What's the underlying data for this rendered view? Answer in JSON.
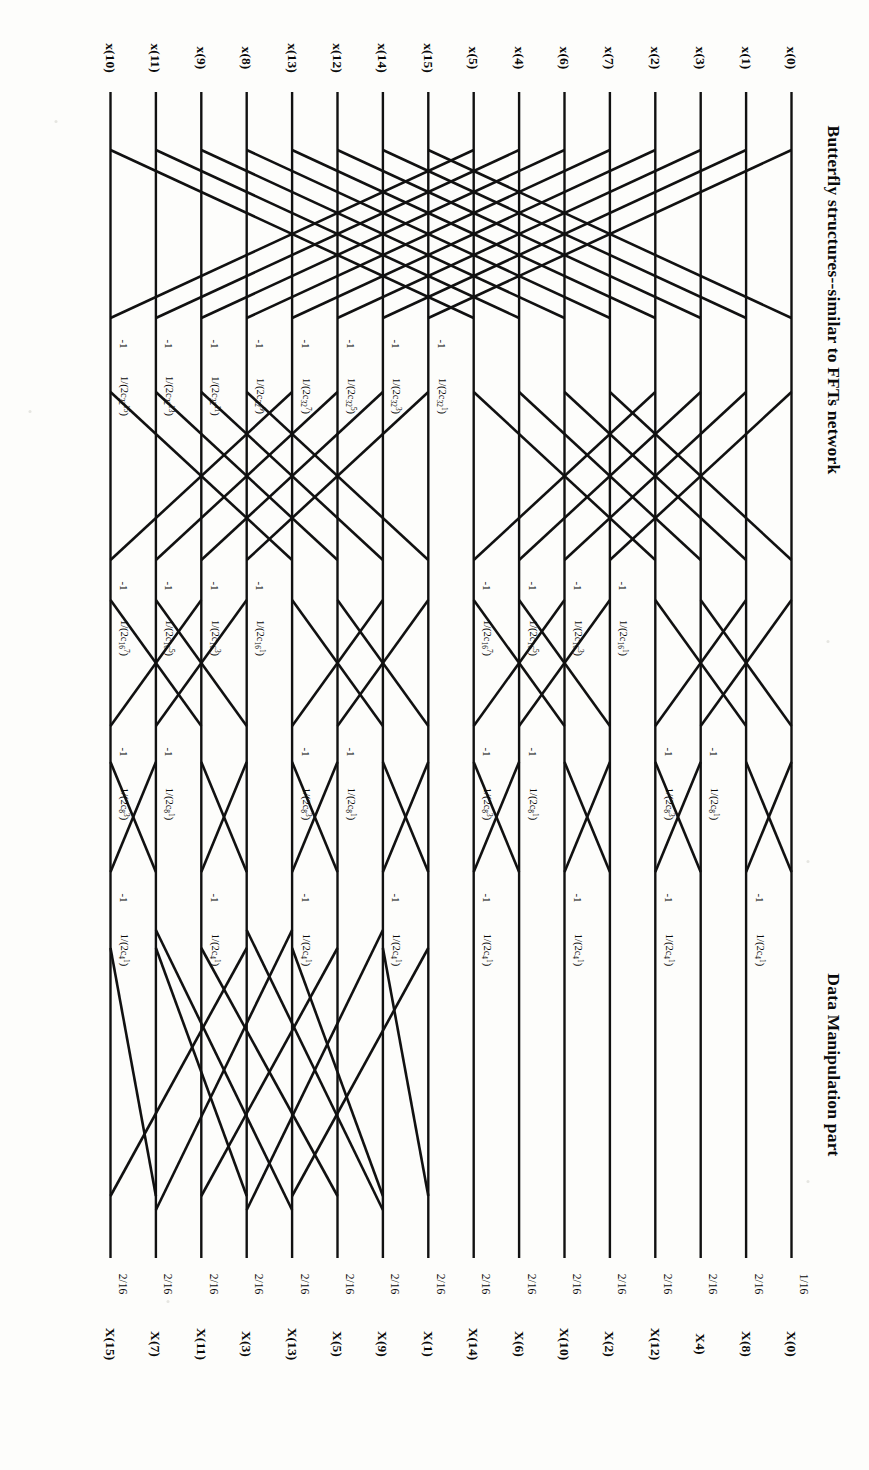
{
  "figure": {
    "title_left": "Butterfly structures--similar to FFTs network",
    "title_right": "Data Manipulation part",
    "type": "signal-flow-graph",
    "n_points": 16,
    "stages": 4,
    "line_color": "#111111",
    "background": "#fdfdfb"
  },
  "inputs": [
    "x(0)",
    "x(1)",
    "x(3)",
    "x(2)",
    "x(7)",
    "x(6)",
    "x(4)",
    "x(5)",
    "x(15)",
    "x(14)",
    "x(12)",
    "x(13)",
    "x(8)",
    "x(9)",
    "x(11)",
    "x(10)"
  ],
  "outputs": [
    "X(0)",
    "X(8)",
    "X4)",
    "X(12)",
    "X(2)",
    "X(10)",
    "X(6)",
    "X(14)",
    "X(1)",
    "X(9)",
    "X(5)",
    "X(13)",
    "X(3)",
    "X(11)",
    "X(7)",
    "X(15)"
  ],
  "output_scales": [
    "1/16",
    "2/16",
    "2/16",
    "2/16",
    "2/16",
    "2/16",
    "2/16",
    "2/16",
    "2/16",
    "2/16",
    "2/16",
    "2/16",
    "2/16",
    "2/16",
    "2/16",
    "2/16"
  ],
  "minus_one": "-1",
  "coefficients": {
    "stage1": [
      "1/(2c₃₂³)",
      "1/(2c₃₂⁵)",
      "1/(2c₃₂⁷)",
      "1/(2c₃₂⁹)",
      "1/(2c₃₂¹¹)",
      "1/(2c₃₂¹³)",
      "1/(2c₃₂¹⁵)",
      "1/(2c₃₂¹)"
    ],
    "stage1_rows": [
      8,
      9,
      10,
      11,
      12,
      13,
      14,
      15
    ],
    "stage2": [
      "1/(2c₁₆¹)",
      "1/(2c₁₆³)",
      "1/(2c₁₆⁵)",
      "1/(2c₁₆⁷)"
    ],
    "stage3": [
      "1/(2c₈¹)",
      "1/(2c₈³)"
    ],
    "stage4": [
      "1/(2c₄¹)"
    ]
  },
  "coef_labels": [
    {
      "row": 4,
      "stage": 1,
      "text": "1/(2c₃₂³)"
    },
    {
      "row": 5,
      "stage": 1,
      "text": "1/(2c₃₂⁵)"
    },
    {
      "row": 6,
      "stage": 1,
      "text": "1/(2c₃₂⁷)"
    },
    {
      "row": 7,
      "stage": 1,
      "text": "1/(2c₃₂⁹)"
    },
    {
      "row": 8,
      "stage": 1,
      "text": "1/(2c₃₂¹¹)"
    },
    {
      "row": 9,
      "stage": 1,
      "text": "1/(2c₃₂¹³)"
    },
    {
      "row": 10,
      "stage": 1,
      "text": "1/(2c₃₂¹⁵)"
    },
    {
      "row": 11,
      "stage": 1,
      "text": "1/(2c₃₂⁹)"
    }
  ],
  "axis_note": "",
  "chart_data": {
    "type": "diagram",
    "rows": 16,
    "butterfly_stages": 4,
    "input_order": [
      "x(0)",
      "x(1)",
      "x(3)",
      "x(2)",
      "x(7)",
      "x(6)",
      "x(4)",
      "x(5)",
      "x(15)",
      "x(14)",
      "x(12)",
      "x(13)",
      "x(8)",
      "x(9)",
      "x(11)",
      "x(10)"
    ],
    "output_order": [
      "X(0)",
      "X(8)",
      "X4)",
      "X(12)",
      "X(2)",
      "X(10)",
      "X(6)",
      "X(14)",
      "X(1)",
      "X(9)",
      "X(5)",
      "X(13)",
      "X(3)",
      "X(11)",
      "X(7)",
      "X(15)"
    ],
    "output_gains": [
      "1/16",
      "2/16",
      "2/16",
      "2/16",
      "2/16",
      "2/16",
      "2/16",
      "2/16",
      "2/16",
      "2/16",
      "2/16",
      "2/16",
      "2/16",
      "2/16",
      "2/16",
      "2/16"
    ]
  }
}
